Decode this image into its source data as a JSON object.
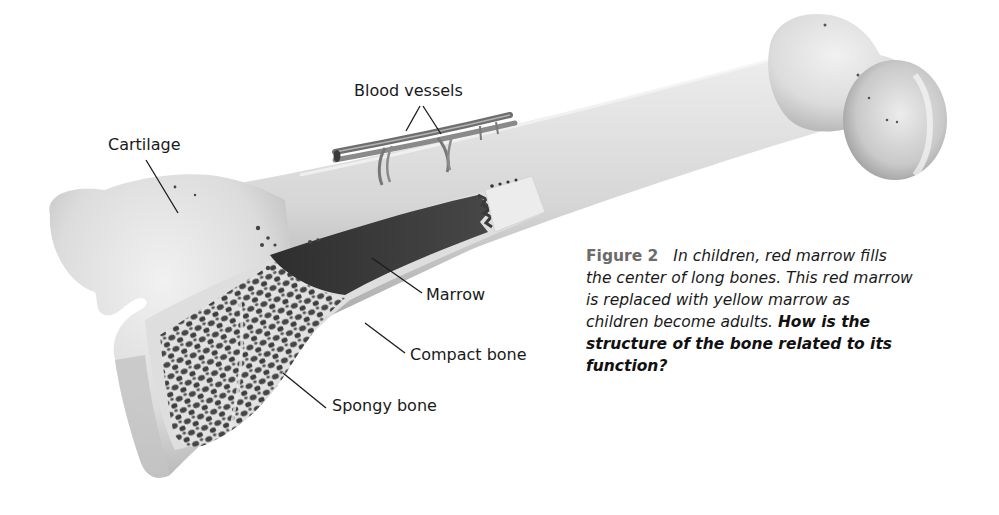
{
  "figure": {
    "number": "Figure 2",
    "caption": "In children, red marrow fills the center of long bones. This red marrow is replaced with yellow marrow as children become adults.",
    "question": "How is the structure of the bone related to its function?"
  },
  "labels": {
    "blood_vessels": "Blood vessels",
    "cartilage": "Cartilage",
    "marrow": "Marrow",
    "compact_bone": "Compact bone",
    "spongy_bone": "Spongy bone"
  },
  "colors": {
    "bone_light": "#e6e6e6",
    "bone_shadow": "#a9a9a9",
    "marrow_dark": "#3a3a3a",
    "spongy_dark": "#4a4a4a",
    "vessel": "#7a7a7a",
    "figure_number": "#6b6b6b",
    "text": "#1a1a1a"
  }
}
